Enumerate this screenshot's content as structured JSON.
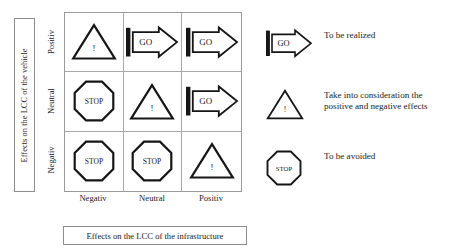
{
  "axes": {
    "y_title": "Effects on the LCC of the vehicle",
    "x_title": "Effects on the LCC of the infrastructure",
    "row_labels": [
      "Positiv",
      "Neutral",
      "Negativ"
    ],
    "col_labels": [
      "Negativ",
      "Neutral",
      "Positiv"
    ]
  },
  "matrix": {
    "cells": [
      {
        "symbol": "warning-triangle",
        "label": "!"
      },
      {
        "symbol": "go-arrow",
        "label": "GO"
      },
      {
        "symbol": "go-arrow",
        "label": "GO"
      },
      {
        "symbol": "stop-octagon",
        "label": "STOP"
      },
      {
        "symbol": "warning-triangle",
        "label": "!"
      },
      {
        "symbol": "go-arrow",
        "label": "GO"
      },
      {
        "symbol": "stop-octagon",
        "label": "STOP"
      },
      {
        "symbol": "stop-octagon",
        "label": "STOP"
      },
      {
        "symbol": "warning-triangle",
        "label": "!"
      }
    ]
  },
  "legend": {
    "items": [
      {
        "symbol": "go-arrow",
        "label": "GO",
        "text": "To be realized"
      },
      {
        "symbol": "warning-triangle",
        "label": "!",
        "text": "Take into consideration the\npositive and negative effects"
      },
      {
        "symbol": "stop-octagon",
        "label": "STOP",
        "text": "To be avoided"
      }
    ]
  },
  "colors": {
    "ink": "#1a1a1a",
    "grid_line": "#a8a8a8",
    "box_border": "#8d8d8d",
    "background": "#ffffff"
  }
}
